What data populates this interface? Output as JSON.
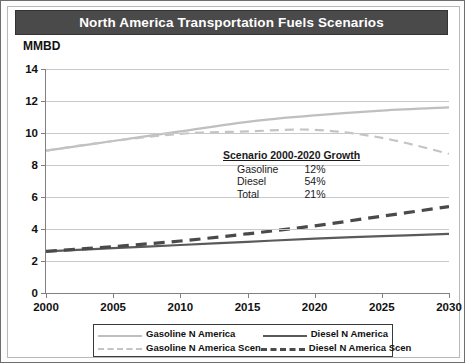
{
  "title": "North America Transportation Fuels Scenarios",
  "unit_label": "MMBD",
  "annotation": {
    "title": "Scenario 2000-2020 Growth",
    "rows": [
      {
        "label": "Gasoline",
        "value": "12%"
      },
      {
        "label": "Diesel",
        "value": "54%"
      },
      {
        "label": "Total",
        "value": "21%"
      }
    ]
  },
  "legend": {
    "items": [
      {
        "label": "Gasoline N America",
        "style": "solid-light"
      },
      {
        "label": "Diesel N America",
        "style": "solid-dark"
      },
      {
        "label": "Gasoline N America Scen",
        "style": "dashed-light"
      },
      {
        "label": "Diesel N America Scen",
        "style": "dashed-dark"
      }
    ]
  },
  "colors": {
    "title_bar": "#4a4a4a",
    "gasoline": "#bfbfbf",
    "gasoline_scen": "#c4c4c4",
    "diesel": "#5a5a5a",
    "diesel_scen": "#4a4a4a",
    "grid": "#c9c9c9",
    "axis": "#808080"
  },
  "chart_data": {
    "type": "line",
    "title": "North America Transportation Fuels Scenarios",
    "xlabel": "",
    "ylabel": "MMBD",
    "ylim": [
      0,
      14
    ],
    "xlim": [
      2000,
      2030
    ],
    "yticks": [
      0,
      2,
      4,
      6,
      8,
      10,
      12,
      14
    ],
    "xticks": [
      2000,
      2005,
      2010,
      2015,
      2020,
      2025,
      2030
    ],
    "grid": true,
    "legend_position": "bottom",
    "x": [
      2000,
      2005,
      2010,
      2015,
      2020,
      2025,
      2030
    ],
    "series": [
      {
        "name": "Gasoline N America",
        "style": "solid",
        "color": "#bfbfbf",
        "values": [
          8.9,
          9.5,
          10.1,
          10.7,
          11.1,
          11.4,
          11.6
        ]
      },
      {
        "name": "Gasoline N America Scen",
        "style": "dashed",
        "color": "#c4c4c4",
        "values": [
          8.9,
          9.5,
          9.95,
          10.1,
          10.2,
          9.7,
          8.7
        ]
      },
      {
        "name": "Diesel N America",
        "style": "solid",
        "color": "#5a5a5a",
        "values": [
          2.6,
          2.8,
          3.0,
          3.2,
          3.4,
          3.55,
          3.7
        ]
      },
      {
        "name": "Diesel N America Scen",
        "style": "dashed",
        "color": "#4a4a4a",
        "values": [
          2.6,
          2.9,
          3.25,
          3.7,
          4.2,
          4.8,
          5.4
        ]
      }
    ],
    "annotations": [
      {
        "text": "Scenario 2000-2020 Growth",
        "items": [
          {
            "label": "Gasoline",
            "value": "12%"
          },
          {
            "label": "Diesel",
            "value": "54%"
          },
          {
            "label": "Total",
            "value": "21%"
          }
        ]
      }
    ]
  }
}
